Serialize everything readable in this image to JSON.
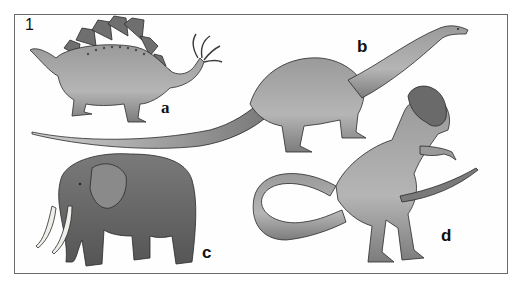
{
  "figure": {
    "panel_number": "1",
    "labels": [
      {
        "id": "a",
        "text": "a",
        "subject": "stegosaurus"
      },
      {
        "id": "b",
        "text": "b",
        "subject": "brontosaurus"
      },
      {
        "id": "c",
        "text": "c",
        "subject": "elephant"
      },
      {
        "id": "d",
        "text": "d",
        "subject": "tyrannosaurus"
      }
    ],
    "colors": {
      "frame": "#6a6a6a",
      "body_light": "#b9b9b9",
      "body_mid": "#8f8f8f",
      "body_dark": "#5e5e5e",
      "plates": "#6f6f6f",
      "tusk": "#eeeeea",
      "outline": "#2a2a2a"
    }
  }
}
